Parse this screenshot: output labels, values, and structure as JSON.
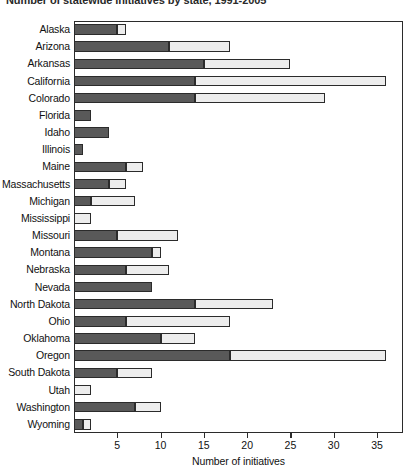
{
  "chart_data": {
    "type": "bar",
    "orientation": "horizontal",
    "stacked": true,
    "title": "Number of statewide initiatives by state, 1991-2005",
    "xlabel": "Number of initiatives",
    "ylabel": "",
    "xlim": [
      0,
      38
    ],
    "xticks": [
      5,
      10,
      15,
      20,
      25,
      30,
      35
    ],
    "xticklabels": [
      "5",
      "10",
      "15",
      "20",
      "25",
      "30",
      "35"
    ],
    "grid": false,
    "legend": "none",
    "categories": [
      "Alaska",
      "Arizona",
      "Arkansas",
      "California",
      "Colorado",
      "Florida",
      "Idaho",
      "Illinois",
      "Maine",
      "Massachusetts",
      "Michigan",
      "Mississippi",
      "Missouri",
      "Montana",
      "Nebraska",
      "Nevada",
      "North Dakota",
      "Ohio",
      "Oklahoma",
      "Oregon",
      "South Dakota",
      "Utah",
      "Washington",
      "Wyoming"
    ],
    "series": [
      {
        "name": "dark-segment",
        "color": "#595959",
        "values": [
          5,
          11,
          15,
          14,
          14,
          2,
          4,
          1,
          6,
          4,
          2,
          0,
          5,
          9,
          6,
          9,
          14,
          6,
          10,
          18,
          5,
          0,
          7,
          1
        ]
      },
      {
        "name": "light-segment",
        "color": "#ededed",
        "values": [
          1,
          7,
          10,
          22,
          15,
          0,
          0,
          0,
          2,
          2,
          5,
          2,
          7,
          1,
          5,
          0,
          9,
          12,
          4,
          18,
          4,
          2,
          3,
          1
        ]
      }
    ],
    "totals": [
      6,
      18,
      25,
      36,
      29,
      2,
      4,
      1,
      8,
      6,
      7,
      2,
      12,
      10,
      11,
      9,
      23,
      18,
      14,
      36,
      9,
      2,
      10,
      2
    ]
  },
  "colors": {
    "dark_segment": "#595959",
    "light_segment": "#ededed",
    "outline": "#2b2b2b",
    "background": "#ffffff",
    "text": "#111111"
  }
}
